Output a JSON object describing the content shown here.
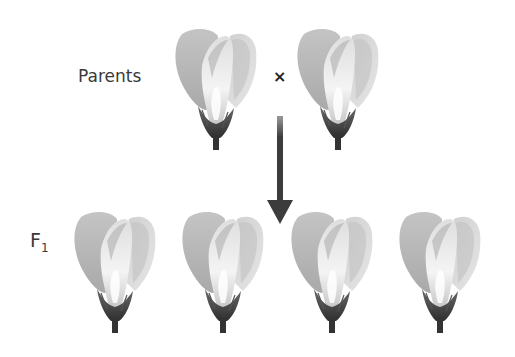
{
  "diagram": {
    "labels": {
      "parents": "Parents",
      "f1_letter": "F",
      "f1_subscript": "1"
    },
    "cross_symbol": "×",
    "flower_color": "#b9b9b9",
    "arrow_color": "#3c3c3c",
    "parents": [
      {
        "id": "parent-1",
        "x": 172,
        "y": 26
      },
      {
        "id": "parent-2",
        "x": 294,
        "y": 26
      }
    ],
    "offspring": [
      {
        "id": "f1-1",
        "x": 71,
        "y": 209
      },
      {
        "id": "f1-2",
        "x": 179,
        "y": 209
      },
      {
        "id": "f1-3",
        "x": 288,
        "y": 209
      },
      {
        "id": "f1-4",
        "x": 396,
        "y": 209
      }
    ]
  }
}
